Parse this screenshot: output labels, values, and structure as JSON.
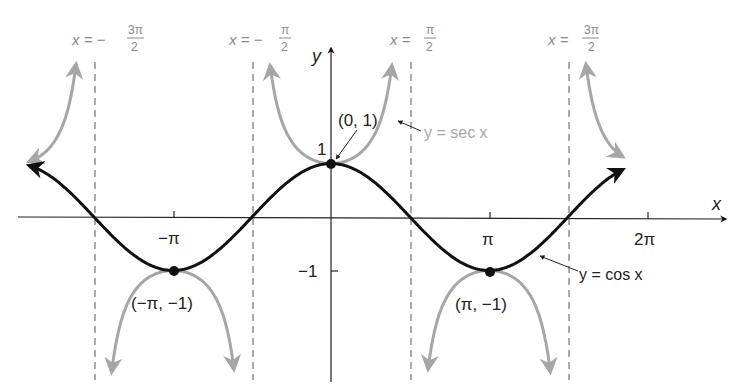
{
  "chart_data": {
    "type": "line",
    "title": "",
    "xlabel": "x",
    "ylabel": "y",
    "series": [
      {
        "name": "y = cos x",
        "function": "cos",
        "color": "#111111",
        "domain": [
          -6.0,
          5.8
        ]
      },
      {
        "name": "y = sec x",
        "function": "sec",
        "color": "#a6a6a6",
        "domain": [
          -6.0,
          5.8
        ]
      }
    ],
    "x_ticks": [
      "−π",
      "π",
      "2π"
    ],
    "y_ticks": [
      "1",
      "−1"
    ],
    "asymptotes": [
      "x = −3π/2",
      "x = −π/2",
      "x = π/2",
      "x = 3π/2"
    ],
    "points": [
      {
        "label": "(0, 1)",
        "x": 0,
        "y": 1
      },
      {
        "label": "(−π, −1)",
        "x": -3.14159,
        "y": -1
      },
      {
        "label": "(π, −1)",
        "x": 3.14159,
        "y": -1
      }
    ],
    "grid": false,
    "legend": "annotations"
  },
  "labels": {
    "asym1": {
      "lhs": "x = −",
      "num": "3π",
      "den": "2"
    },
    "asym2": {
      "lhs": "x = −",
      "num": "π",
      "den": "2"
    },
    "asym3": {
      "lhs": "x = ",
      "num": "π",
      "den": "2"
    },
    "asym4": {
      "lhs": "x = ",
      "num": "3π",
      "den": "2"
    },
    "x_axis": "x",
    "y_axis": "y",
    "tick_neg_pi": "−π",
    "tick_pi": "π",
    "tick_2pi": "2π",
    "tick_1": "1",
    "tick_neg1": "−1",
    "pt_origin": "(0, 1)",
    "pt_negpi": "(−π, −1)",
    "pt_pi": "(π, −1)",
    "sec_label": "y = sec x",
    "cos_label": "y = cos x"
  }
}
